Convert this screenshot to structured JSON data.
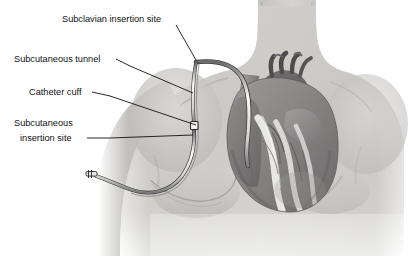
{
  "illustration": {
    "title": "Tunneled central venous catheter placement — anterior chest anatomy",
    "subject": "human-torso-anterior-view",
    "style": "grayscale medical line illustration"
  },
  "colors": {
    "background": "#ffffff",
    "skin_light": "#d9d8d5",
    "skin_mid": "#c4c3c0",
    "skin_shadow": "#a8a7a4",
    "skin_deep": "#8d8c8a",
    "outline": "#6f6e6c",
    "heart_dark": "#5f5e5e",
    "heart_mid": "#8a8888",
    "heart_light": "#a9a7a6",
    "vessel": "#9a9897",
    "fat_white": "#f1f1ef",
    "catheter_fill": "#ececea",
    "catheter_line": "#3a3a3a",
    "leader_line": "#111111",
    "label_text": "#111111"
  },
  "labels": [
    {
      "id": "subclavian-insertion-site",
      "text": "Subclavian insertion site",
      "text_x": 62,
      "text_y": 22,
      "anchor": "start",
      "leader": "M 176 25 L 196 60"
    },
    {
      "id": "subcutaneous-tunnel",
      "text": "Subcutaneous tunnel",
      "text_x": 14,
      "text_y": 62,
      "anchor": "start",
      "leader": "M 116 59 L 130 66 L 193 93"
    },
    {
      "id": "catheter-cuff",
      "text": "Catheter cuff",
      "text_x": 29,
      "text_y": 95,
      "anchor": "start",
      "leader": "M 92 92 L 110 96 L 196 125"
    },
    {
      "id": "subcutaneous-insertion-site",
      "text": "Subcutaneous\ninsertion site",
      "line1": "Subcutaneous",
      "line2": "insertion site",
      "text_x": 14,
      "text_y": 126,
      "anchor": "start",
      "leader": "M 87 138 L 110 138 L 193 135"
    }
  ],
  "anatomy_parts": [
    {
      "id": "torso",
      "label": "Torso and shoulders"
    },
    {
      "id": "neck",
      "label": "Neck"
    },
    {
      "id": "left-arm",
      "label": "Patient left arm"
    },
    {
      "id": "right-arm",
      "label": "Patient right arm"
    },
    {
      "id": "left-breast",
      "label": "Left breast contour"
    },
    {
      "id": "right-breast",
      "label": "Right breast contour"
    },
    {
      "id": "clavicle-contours",
      "label": "Clavicle and deltoid contour lines"
    },
    {
      "id": "heart",
      "label": "Heart"
    },
    {
      "id": "right-atrium",
      "label": "Right atrium"
    },
    {
      "id": "right-ventricle",
      "label": "Right ventricle"
    },
    {
      "id": "left-ventricle",
      "label": "Left ventricle"
    },
    {
      "id": "aortic-arch",
      "label": "Aortic arch"
    },
    {
      "id": "brachiocephalic-vessels",
      "label": "Brachiocephalic vessels"
    },
    {
      "id": "superior-vena-cava",
      "label": "Superior vena cava"
    },
    {
      "id": "pulmonary-artery",
      "label": "Pulmonary artery"
    },
    {
      "id": "coronary-vessels",
      "label": "Coronary vessels"
    },
    {
      "id": "epicardial-fat",
      "label": "Epicardial fat"
    }
  ],
  "device": {
    "name": "tunneled central venous catheter",
    "parts": [
      {
        "id": "catheter-intravascular-segment",
        "label": "Intravascular catheter segment in superior vena cava"
      },
      {
        "id": "catheter-tunnel-segment",
        "label": "Subcutaneous tunnel segment"
      },
      {
        "id": "catheter-external-segment",
        "label": "External catheter segment"
      },
      {
        "id": "catheter-cuff-bead",
        "label": "Dacron cuff"
      },
      {
        "id": "catheter-hub",
        "label": "Catheter hub and clamp"
      }
    ]
  }
}
